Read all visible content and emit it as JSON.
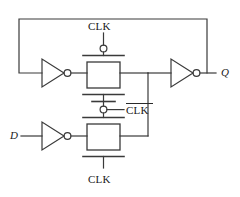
{
  "figure": {
    "kind": "circuit-schematic",
    "line_color": "#3a3a3a",
    "text_color": "#1a1a1a",
    "background": "#ffffff"
  },
  "labels": {
    "clk_top": "CLK",
    "clk_mid": "CLK",
    "clk_mid_overbar": true,
    "clk_bottom": "CLK",
    "input_d": "D",
    "output_q": "Q"
  },
  "components": {
    "inverters": [
      {
        "name": "feedback-inverter",
        "position": "upper-left",
        "has_output_bubble": true
      },
      {
        "name": "input-inverter",
        "position": "lower-left",
        "has_output_bubble": true
      },
      {
        "name": "output-inverter",
        "position": "upper-right",
        "has_output_bubble": true
      }
    ],
    "transmission_gates": [
      {
        "name": "slave-gate",
        "position": "upper-middle",
        "top_gate_signal": "CLK",
        "top_gate_bubble": true,
        "bottom_gate_signal": "CLK-bar",
        "bottom_gate_bubble": true
      },
      {
        "name": "master-gate",
        "position": "lower-middle",
        "top_gate_signal": "CLK-bar",
        "top_gate_bubble": true,
        "bottom_gate_signal": "CLK",
        "bottom_gate_bubble": false
      }
    ],
    "nets": [
      {
        "name": "feedback-net",
        "from": "Q node",
        "to": "feedback inverter input",
        "path": "up-left-around-top"
      },
      {
        "name": "internal-node",
        "from": "master gate output",
        "to": "slave gate output",
        "path": "vertical-right"
      }
    ]
  }
}
